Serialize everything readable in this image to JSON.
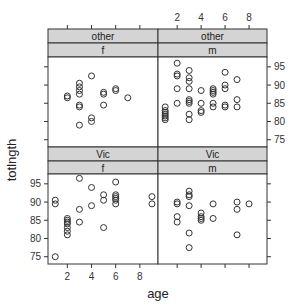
{
  "chart_data": {
    "type": "scatter",
    "layout": "lattice 2x2 trellis",
    "xlabel": "age",
    "ylabel": "totlngth",
    "xlim": [
      0.4,
      9.5
    ],
    "ylim": [
      73,
      97.7
    ],
    "x_ticks": [
      2,
      4,
      6,
      8
    ],
    "y_ticks": [
      75,
      80,
      85,
      90,
      95
    ],
    "grid": false,
    "marker": "open-circle",
    "panels": [
      {
        "strip_outer": "other",
        "strip_inner": "f",
        "position": "top-left",
        "points": [
          [
            2,
            87
          ],
          [
            2,
            86.5
          ],
          [
            3,
            90.5
          ],
          [
            3,
            89.5
          ],
          [
            3,
            88.5
          ],
          [
            3,
            87.5
          ],
          [
            3,
            84.5
          ],
          [
            3,
            84
          ],
          [
            3,
            79
          ],
          [
            4,
            92.5
          ],
          [
            4,
            81
          ],
          [
            4,
            80
          ],
          [
            5,
            88
          ],
          [
            5,
            87.5
          ],
          [
            5,
            84.5
          ],
          [
            6,
            89
          ],
          [
            6,
            88.5
          ],
          [
            7,
            86.5
          ]
        ]
      },
      {
        "strip_outer": "other",
        "strip_inner": "m",
        "position": "top-right",
        "points": [
          [
            1,
            84
          ],
          [
            1,
            83
          ],
          [
            1,
            82.5
          ],
          [
            1,
            82
          ],
          [
            1,
            81.5
          ],
          [
            1,
            81
          ],
          [
            1,
            80.5
          ],
          [
            2,
            96
          ],
          [
            2,
            93
          ],
          [
            2,
            92.5
          ],
          [
            2,
            89
          ],
          [
            2,
            85
          ],
          [
            3,
            94
          ],
          [
            3,
            92
          ],
          [
            3,
            91
          ],
          [
            3,
            89
          ],
          [
            3,
            86
          ],
          [
            3,
            85.5
          ],
          [
            3,
            85
          ],
          [
            3,
            82
          ],
          [
            3,
            80.5
          ],
          [
            4,
            88.5
          ],
          [
            4,
            85
          ],
          [
            4,
            83
          ],
          [
            4,
            82.5
          ],
          [
            5,
            89
          ],
          [
            5,
            88.5
          ],
          [
            5,
            88
          ],
          [
            5,
            87.5
          ],
          [
            5,
            85
          ],
          [
            5,
            84
          ],
          [
            6,
            93.5
          ],
          [
            6,
            90
          ],
          [
            6,
            89
          ],
          [
            6,
            84.5
          ],
          [
            6,
            84
          ],
          [
            7,
            91.5
          ],
          [
            7,
            86
          ],
          [
            7,
            84
          ]
        ]
      },
      {
        "strip_outer": "Vic",
        "strip_inner": "f",
        "position": "bottom-left",
        "points": [
          [
            1,
            90.5
          ],
          [
            1,
            89.5
          ],
          [
            1,
            75
          ],
          [
            2,
            85.5
          ],
          [
            2,
            85
          ],
          [
            2,
            84.5
          ],
          [
            2,
            84
          ],
          [
            2,
            83
          ],
          [
            2,
            82
          ],
          [
            2,
            81
          ],
          [
            3,
            96.5
          ],
          [
            3,
            88
          ],
          [
            3,
            84.5
          ],
          [
            4,
            94
          ],
          [
            4,
            89
          ],
          [
            5,
            92
          ],
          [
            5,
            90.5
          ],
          [
            5,
            83
          ],
          [
            6,
            95.5
          ],
          [
            6,
            92
          ],
          [
            6,
            91.5
          ],
          [
            6,
            91
          ],
          [
            6,
            90.5
          ],
          [
            6,
            89.5
          ],
          [
            9,
            91.5
          ],
          [
            9,
            89.5
          ]
        ]
      },
      {
        "strip_outer": "Vic",
        "strip_inner": "m",
        "position": "bottom-right",
        "points": [
          [
            2,
            90
          ],
          [
            2,
            89.5
          ],
          [
            2,
            86
          ],
          [
            2,
            84.5
          ],
          [
            3,
            93
          ],
          [
            3,
            92
          ],
          [
            3,
            91.5
          ],
          [
            3,
            89
          ],
          [
            3,
            81.5
          ],
          [
            3,
            77.5
          ],
          [
            4,
            87
          ],
          [
            4,
            86
          ],
          [
            4,
            85.5
          ],
          [
            4,
            85
          ],
          [
            5,
            89.5
          ],
          [
            5,
            85.5
          ],
          [
            7,
            90
          ],
          [
            7,
            88
          ],
          [
            7,
            81
          ],
          [
            8,
            89.5
          ]
        ]
      }
    ]
  },
  "colors": {
    "strip_bg": "#d4d4d4",
    "frame": "#333333",
    "point": "#333333",
    "background": "#ffffff"
  }
}
